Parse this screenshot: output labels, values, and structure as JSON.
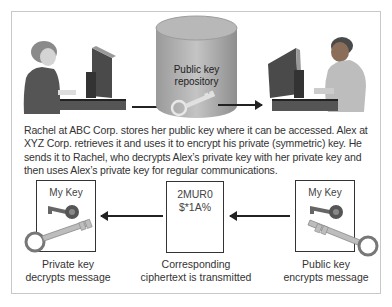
{
  "top_row": {
    "left_person": "Rachel at computer",
    "repository_label_line1": "Public key",
    "repository_label_line2": "repository",
    "right_person": "Alex at computer"
  },
  "caption": "Rachel at ABC Corp. stores her public key where it can be accessed. Alex at XYZ Corp. retrieves it and uses it to encrypt his private (symmetric) key. He sends it to Rachel, who decrypts Alex’s private key with her private key and then uses Alex’s private key for regular communications.",
  "bottom_row": {
    "left_box": {
      "title": "My Key",
      "label_line1": "Private key",
      "label_line2": "decrypts message"
    },
    "middle_box": {
      "cipher_line1": "2MUR0",
      "cipher_line2": "$*1A%",
      "label_line1": "Corresponding",
      "label_line2": "ciphertext is transmitted"
    },
    "right_box": {
      "title": "My Key",
      "label_line1": "Public key",
      "label_line2": "encrypts message"
    }
  },
  "icons": [
    "person-woman-computer-icon",
    "database-cylinder-icon",
    "key-icon",
    "person-man-computer-icon",
    "small-key-icon",
    "large-key-icon"
  ],
  "colors": {
    "frame_border": "#c8c8c8",
    "box_border": "#333333",
    "arrow": "#222222",
    "cylinder": "#a8a8a8"
  }
}
